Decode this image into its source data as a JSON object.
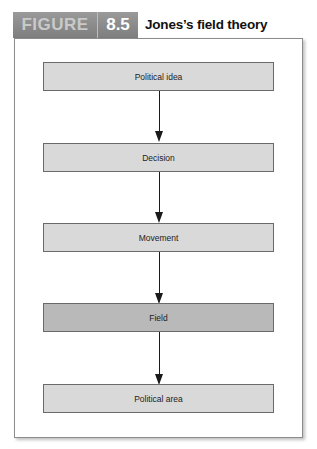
{
  "figure": {
    "label": "FIGURE",
    "number": "8.5",
    "title": "Jones’s field theory"
  },
  "colors": {
    "tab_background": "#8a8a8a",
    "tab_label_text": "#c9c9c9",
    "tab_number_text": "#ffffff",
    "box_fill": "#d9d9d9",
    "highlight_box_fill": "#b9b9b9",
    "arrow": "#1a1a1a"
  },
  "diagram": {
    "type": "vertical-flowchart",
    "nodes": [
      {
        "id": "political-idea",
        "label": "Political idea",
        "highlighted": false
      },
      {
        "id": "decision",
        "label": "Decision",
        "highlighted": false
      },
      {
        "id": "movement",
        "label": "Movement",
        "highlighted": false
      },
      {
        "id": "field",
        "label": "Field",
        "highlighted": true
      },
      {
        "id": "political-area",
        "label": "Political area",
        "highlighted": false
      }
    ],
    "edges": [
      {
        "from": "political-idea",
        "to": "decision"
      },
      {
        "from": "decision",
        "to": "movement"
      },
      {
        "from": "movement",
        "to": "field"
      },
      {
        "from": "field",
        "to": "political-area"
      }
    ]
  }
}
